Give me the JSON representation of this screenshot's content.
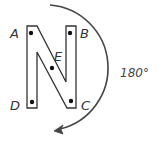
{
  "diagram": {
    "rotation_label": "180°",
    "points": [
      {
        "name": "A",
        "x": 31,
        "y": 33,
        "label_x": 12,
        "label_y": 38
      },
      {
        "name": "B",
        "x": 70,
        "y": 33,
        "label_x": 80,
        "label_y": 38
      },
      {
        "name": "C",
        "x": 71,
        "y": 101,
        "label_x": 81,
        "label_y": 110
      },
      {
        "name": "D",
        "x": 32,
        "y": 102,
        "label_x": 11,
        "label_y": 110
      },
      {
        "name": "E",
        "x": 52,
        "y": 68,
        "label_x": 54,
        "label_y": 62
      }
    ],
    "colors": {
      "stroke": "#333333",
      "arc": "#444444",
      "background": "#ffffff"
    }
  }
}
